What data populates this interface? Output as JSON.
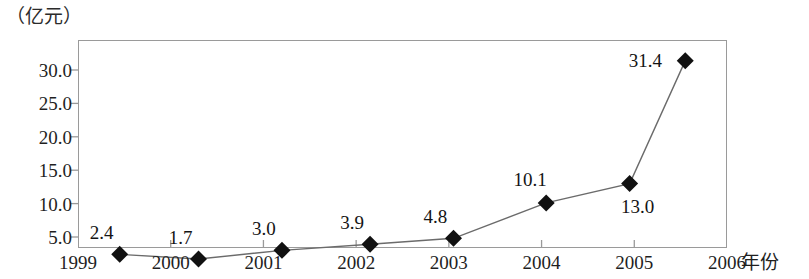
{
  "chart_data": {
    "type": "line",
    "title": "",
    "subtitle": "",
    "unit_label": "（亿元）",
    "xlabel": "年份",
    "ylabel": "",
    "grid": false,
    "legend": null,
    "x_tick_labels": [
      "1999",
      "2000",
      "2001",
      "2002",
      "2003",
      "2004",
      "2005",
      "2006"
    ],
    "y_tick_labels": [
      "5.0",
      "10.0",
      "15.0",
      "20.0",
      "25.0",
      "30.0"
    ],
    "y_ticks": [
      5.0,
      10.0,
      15.0,
      20.0,
      25.0,
      30.0
    ],
    "ylim": [
      1.0,
      32.5
    ],
    "xlim": [
      1999,
      2006
    ],
    "x": [
      1999.45,
      2000.3,
      2001.2,
      2002.15,
      2003.05,
      2004.05,
      2004.95,
      2005.55
    ],
    "values": [
      2.4,
      1.7,
      3.0,
      3.9,
      4.8,
      10.1,
      13.0,
      31.4
    ],
    "point_labels": [
      "2.4",
      "1.7",
      "3.0",
      "3.9",
      "4.8",
      "10.1",
      "13.0",
      "31.4"
    ],
    "marker": "diamond",
    "marker_color": "#111111",
    "line_color": "#6b6b6b",
    "frame_color": "#9a9a9a",
    "label_offsets": [
      {
        "dx": -18,
        "dy": -22
      },
      {
        "dx": -18,
        "dy": -22
      },
      {
        "dx": -18,
        "dy": -22
      },
      {
        "dx": -18,
        "dy": -22
      },
      {
        "dx": -18,
        "dy": -22
      },
      {
        "dx": -16,
        "dy": -24
      },
      {
        "dx": 8,
        "dy": 22
      },
      {
        "dx": -40,
        "dy": -1
      }
    ]
  },
  "axis": {
    "x_name": "年份",
    "unit": "（亿元）"
  }
}
